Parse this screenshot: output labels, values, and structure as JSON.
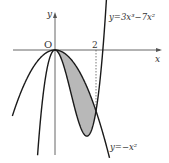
{
  "diagram": {
    "axes": {
      "x_label": "x",
      "y_label": "y",
      "origin_label": "O",
      "tick_label": "2"
    },
    "curves": [
      {
        "name": "cubic",
        "label": "y=3x³−7x²",
        "expr": "3x^3-7x^2"
      },
      {
        "name": "parabola",
        "label": "y=−x²",
        "expr": "-x^2"
      }
    ],
    "shaded_region": {
      "between": [
        "y=-x^2",
        "y=3x^3-7x^2"
      ],
      "x_from": 0,
      "x_to": 2,
      "fill": "#b8b8b8"
    },
    "colors": {
      "curve": "#1a1a1a",
      "axis": "#555555",
      "shade": "#b8b8b8"
    }
  }
}
